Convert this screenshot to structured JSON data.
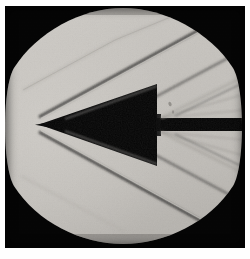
{
  "figure": {
    "kind": "schlieren-photograph",
    "caption": ""
  },
  "colors": {
    "plate_background": "#050505",
    "window_light": "#c9c6c1",
    "window_light_mid": "#c3c0bb",
    "window_light_dim": "#b4b1ac",
    "model_dark": "#060606",
    "shock_line": "#1b1b1b",
    "shock_line_soft": "#8d8a86",
    "highlight": "#e3e0db",
    "page_background": "#ffffff"
  },
  "window": {
    "name": "circular-test-section-window",
    "center_x": 123,
    "center_y": 119,
    "radius": 117,
    "top_clip_y": 6,
    "bottom_clip_y": 232
  },
  "model": {
    "name": "cone-cylinder-flare-model",
    "nose_tip_x": 38,
    "nose_tip_y": 118,
    "half_angle_deg": 10,
    "flare_shoulder_x": 152,
    "max_half_height": 40,
    "sting_half_height": 7,
    "sting_end_x": 240
  },
  "flow_features": [
    {
      "name": "upper-nose-shock",
      "label": "oblique shock from nose (upper)"
    },
    {
      "name": "lower-nose-shock",
      "label": "oblique shock from nose (lower)"
    },
    {
      "name": "upper-flare-shock",
      "label": "oblique shock from flare shoulder (upper)"
    },
    {
      "name": "lower-flare-shock",
      "label": "oblique shock from flare shoulder (lower)"
    },
    {
      "name": "upper-expansion-fan",
      "label": "expansion fan at base step (upper)"
    },
    {
      "name": "lower-expansion-fan",
      "label": "expansion fan at base step (lower)"
    },
    {
      "name": "upper-sting-shock",
      "label": "recompression shock along sting (upper)"
    },
    {
      "name": "lower-sting-shock",
      "label": "recompression shock along sting (lower)"
    },
    {
      "name": "boundary-layer-upper",
      "label": "boundary layer trace (upper surface)"
    },
    {
      "name": "boundary-layer-lower",
      "label": "boundary layer trace (lower surface)"
    }
  ],
  "blemishes": [
    {
      "name": "window-speck-upper-right",
      "x": 192,
      "y": 20
    },
    {
      "name": "window-speck-flare",
      "x": 169,
      "y": 100
    },
    {
      "name": "window-speck-sting",
      "x": 172,
      "y": 107
    }
  ]
}
